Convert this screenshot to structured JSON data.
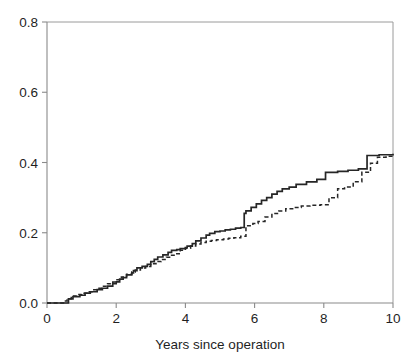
{
  "chart_data": {
    "type": "line",
    "title": "",
    "subtitle": "",
    "xlabel": "Years since operation",
    "ylabel": "",
    "xlim": [
      0,
      10
    ],
    "ylim": [
      0,
      0.8
    ],
    "xticks": [
      0,
      2,
      4,
      6,
      8,
      10
    ],
    "xticklabels": [
      "0",
      "2",
      "4",
      "6",
      "8",
      "10"
    ],
    "yticks": [
      0.0,
      0.2,
      0.4,
      0.6,
      0.8
    ],
    "yticklabels": [
      "0.0",
      "0.2",
      "0.4",
      "0.6",
      "0.8"
    ],
    "grid": false,
    "legend": null,
    "legend_position": "none",
    "step_style": "post",
    "annotations": [],
    "series": [
      {
        "name": "solid-curve",
        "style": "solid",
        "color": "#262626",
        "x": [
          0.0,
          0.55,
          0.62,
          0.75,
          0.95,
          1.1,
          1.25,
          1.45,
          1.6,
          1.75,
          1.9,
          2.0,
          2.1,
          2.2,
          2.3,
          2.45,
          2.5,
          2.6,
          2.75,
          2.9,
          3.0,
          3.1,
          3.2,
          3.35,
          3.5,
          3.6,
          3.75,
          3.85,
          4.0,
          4.05,
          4.2,
          4.3,
          4.45,
          4.6,
          4.7,
          4.85,
          5.0,
          5.15,
          5.3,
          5.45,
          5.6,
          5.7,
          5.75,
          5.9,
          6.05,
          6.2,
          6.35,
          6.5,
          6.65,
          6.8,
          7.0,
          7.2,
          7.5,
          7.8,
          8.05,
          8.4,
          8.7,
          9.0,
          9.25,
          9.6,
          10.0
        ],
        "y": [
          0.0,
          0.0,
          0.012,
          0.018,
          0.022,
          0.028,
          0.032,
          0.038,
          0.042,
          0.048,
          0.055,
          0.06,
          0.068,
          0.072,
          0.08,
          0.086,
          0.092,
          0.1,
          0.104,
          0.11,
          0.118,
          0.124,
          0.131,
          0.137,
          0.144,
          0.15,
          0.152,
          0.155,
          0.158,
          0.162,
          0.169,
          0.177,
          0.185,
          0.193,
          0.198,
          0.203,
          0.205,
          0.208,
          0.21,
          0.213,
          0.215,
          0.255,
          0.262,
          0.272,
          0.282,
          0.292,
          0.3,
          0.31,
          0.318,
          0.325,
          0.33,
          0.338,
          0.345,
          0.352,
          0.372,
          0.375,
          0.378,
          0.382,
          0.42,
          0.422,
          0.425
        ]
      },
      {
        "name": "dashed-curve",
        "style": "dashed",
        "color": "#262626",
        "x": [
          0.0,
          0.5,
          0.58,
          0.7,
          0.85,
          1.0,
          1.15,
          1.3,
          1.45,
          1.6,
          1.75,
          1.9,
          2.0,
          2.15,
          2.3,
          2.45,
          2.55,
          2.7,
          2.85,
          3.0,
          3.15,
          3.3,
          3.45,
          3.6,
          3.7,
          3.85,
          4.0,
          4.15,
          4.3,
          4.45,
          4.6,
          4.75,
          4.9,
          5.1,
          5.25,
          5.4,
          5.6,
          5.75,
          5.95,
          6.1,
          6.3,
          6.5,
          6.7,
          6.9,
          7.1,
          7.35,
          7.6,
          7.9,
          8.15,
          8.4,
          8.6,
          8.85,
          9.1,
          9.35,
          9.55,
          9.8,
          10.0
        ],
        "y": [
          0.0,
          0.006,
          0.012,
          0.02,
          0.024,
          0.028,
          0.032,
          0.038,
          0.042,
          0.048,
          0.055,
          0.06,
          0.066,
          0.074,
          0.082,
          0.088,
          0.094,
          0.1,
          0.104,
          0.112,
          0.118,
          0.124,
          0.13,
          0.136,
          0.14,
          0.15,
          0.156,
          0.162,
          0.168,
          0.172,
          0.176,
          0.178,
          0.18,
          0.182,
          0.184,
          0.186,
          0.19,
          0.22,
          0.226,
          0.232,
          0.245,
          0.255,
          0.262,
          0.268,
          0.272,
          0.276,
          0.278,
          0.28,
          0.3,
          0.325,
          0.33,
          0.345,
          0.372,
          0.398,
          0.415,
          0.418,
          0.42
        ]
      }
    ]
  },
  "layout": {
    "plot_left": 47,
    "plot_right": 393,
    "plot_top": 22,
    "plot_bottom": 303
  }
}
